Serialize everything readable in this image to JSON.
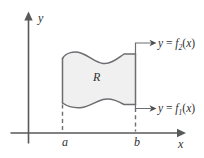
{
  "figure": {
    "type": "region-between-curves-diagram",
    "axes": {
      "y_axis_label": "y",
      "x_axis_label": "x"
    },
    "ticks": {
      "left_bound": "a",
      "right_bound": "b"
    },
    "region": {
      "label": "R",
      "fill_color": "#f0f0f0",
      "edge_color": "#6d6e71"
    },
    "curves": [
      {
        "name": "upper-curve",
        "y_text": "y",
        "equals": "=",
        "fn_text": "f",
        "subscript": "2",
        "arg_open": "(",
        "arg": "x",
        "arg_close": ")",
        "full_label": "y = f2(x)"
      },
      {
        "name": "lower-curve",
        "y_text": "y",
        "equals": "=",
        "fn_text": "f",
        "subscript": "1",
        "arg_open": "(",
        "arg": "x",
        "arg_close": ")",
        "full_label": "y = f1(x)"
      }
    ],
    "colors": {
      "axis": "#58595b",
      "text": "#2f3031",
      "background": "#ffffff"
    }
  }
}
